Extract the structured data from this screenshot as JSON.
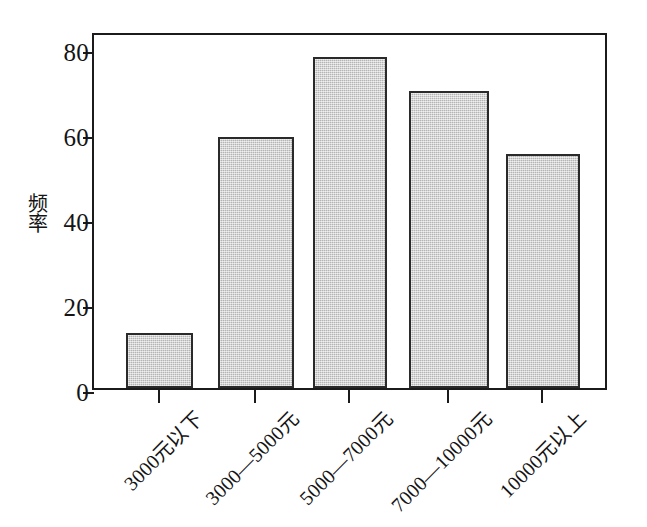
{
  "chart_data": {
    "type": "bar",
    "title": "",
    "subtitle": "",
    "xlabel": "",
    "ylabel": "频率",
    "ylabel_chars": [
      "频",
      "率"
    ],
    "categories": [
      "3000元以下",
      "3000—5000元",
      "5000—7000元",
      "7000—10000元",
      "10000元以上"
    ],
    "values": [
      13,
      59,
      78,
      70,
      55
    ],
    "ylim": [
      0,
      84
    ],
    "yticks": [
      0,
      20,
      40,
      60,
      80
    ],
    "ytick_labels": [
      "0",
      "20",
      "40",
      "60",
      "80"
    ],
    "grid": false,
    "legend": null,
    "legend_position": "none",
    "bar_fill_color": "#c6c6c6",
    "bar_border_color": "#2a2a2a",
    "axis_color": "#1b1b1b",
    "background_color": "#ffffff",
    "xtick_label_rotation": -45
  }
}
